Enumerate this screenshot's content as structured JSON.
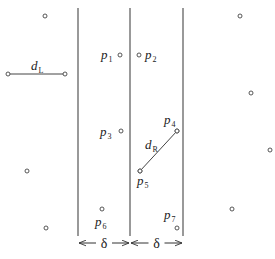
{
  "diagram": {
    "strip_lines_x": [
      78,
      130,
      183
    ],
    "line_top": 8,
    "line_bottom": 236,
    "colors": {
      "line": "#555555",
      "point": "#444444",
      "text": "#222222"
    },
    "labeled_points": [
      {
        "id": "p1",
        "base": "p",
        "sub": "1",
        "x": 120,
        "y": 55,
        "lx": 101,
        "ly": 59
      },
      {
        "id": "p2",
        "base": "p",
        "sub": "2",
        "x": 139,
        "y": 55,
        "lx": 145,
        "ly": 59
      },
      {
        "id": "p3",
        "base": "p",
        "sub": "3",
        "x": 121,
        "y": 131,
        "lx": 100,
        "ly": 136
      },
      {
        "id": "p4",
        "base": "p",
        "sub": "4",
        "x": 177,
        "y": 131,
        "lx": 164,
        "ly": 124
      },
      {
        "id": "p5",
        "base": "p",
        "sub": "5",
        "x": 140,
        "y": 171,
        "lx": 137,
        "ly": 185
      },
      {
        "id": "p6",
        "base": "p",
        "sub": "6",
        "x": 102,
        "y": 209,
        "lx": 95,
        "ly": 226
      },
      {
        "id": "p7",
        "base": "p",
        "sub": "7",
        "x": 177,
        "y": 228,
        "lx": 164,
        "ly": 219
      }
    ],
    "other_points": [
      {
        "x": 45,
        "y": 16
      },
      {
        "x": 240,
        "y": 16
      },
      {
        "x": 251,
        "y": 93
      },
      {
        "x": 270,
        "y": 150
      },
      {
        "x": 27,
        "y": 171
      },
      {
        "x": 232,
        "y": 209
      },
      {
        "x": 46,
        "y": 228
      }
    ],
    "segments": [
      {
        "id": "dL",
        "x1": 8,
        "y1": 74,
        "x2": 65,
        "y2": 74,
        "label_base": "d",
        "label_sub": "L",
        "lx": 31,
        "ly": 70
      },
      {
        "id": "dR",
        "x1": 177,
        "y1": 131,
        "x2": 140,
        "y2": 171,
        "label_base": "d",
        "label_sub": "R",
        "lx": 145,
        "ly": 149
      }
    ],
    "dimensions": [
      {
        "label": "δ",
        "x1": 78,
        "x2": 130,
        "y": 243
      },
      {
        "label": "δ",
        "x1": 130,
        "x2": 183,
        "y": 243
      }
    ]
  }
}
